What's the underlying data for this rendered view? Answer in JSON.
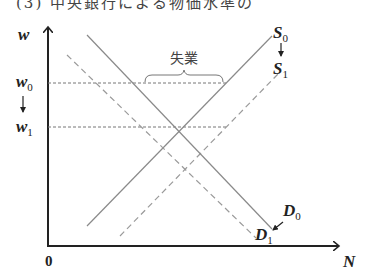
{
  "header": {
    "cutoff_text": "(3) 中央銀行による物価水準の"
  },
  "diagram": {
    "y_axis_label": "w",
    "x_axis_label": "N",
    "origin_label": "0",
    "wage_levels": [
      {
        "symbol": "w",
        "subscript": "0"
      },
      {
        "symbol": "w",
        "subscript": "1"
      }
    ],
    "curves": {
      "S0": {
        "symbol": "S",
        "subscript": "0",
        "style": "solid"
      },
      "S1": {
        "symbol": "S",
        "subscript": "1",
        "style": "dashed"
      },
      "D0": {
        "symbol": "D",
        "subscript": "0",
        "style": "solid"
      },
      "D1": {
        "symbol": "D",
        "subscript": "1",
        "style": "dashed"
      }
    },
    "annotation": "失業",
    "colors": {
      "axis": "#222222",
      "curve": "#8a8a8a",
      "dashed": "#9a9a9a",
      "guide": "#777777"
    }
  }
}
